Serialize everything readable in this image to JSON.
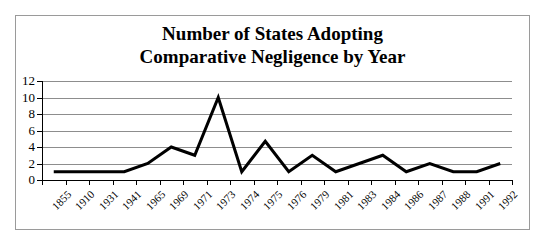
{
  "figure": {
    "border_color": "#9a9a9a",
    "background": "#ffffff"
  },
  "chart_data": {
    "type": "line",
    "title": "Number of States Adopting Comparative Negligence by Year",
    "title_line1": "Number of States Adopting",
    "title_line2": "Comparative Negligence by Year",
    "xlabel": "",
    "ylabel": "",
    "categories": [
      "1855",
      "1910",
      "1931",
      "1941",
      "1965",
      "1969",
      "1971",
      "1973",
      "1974",
      "1975",
      "1976",
      "1979",
      "1981",
      "1983",
      "1984",
      "1986",
      "1987",
      "1988",
      "1991",
      "1992"
    ],
    "values": [
      1,
      1,
      1,
      1,
      2,
      4,
      3,
      10,
      1,
      4.7,
      1,
      3,
      1,
      2,
      3,
      1,
      2,
      1,
      1,
      2
    ],
    "ylim": [
      0,
      12
    ],
    "ytick_labels": [
      "12",
      "10",
      "8",
      "6",
      "4",
      "2",
      "0"
    ],
    "ytick_values": [
      12,
      10,
      8,
      6,
      4,
      2,
      0
    ],
    "grid": true,
    "grid_color": "#8d8d8d",
    "line_color": "#000000",
    "line_width": 3,
    "legend": false,
    "legend_position": "none",
    "xlabel_rotation": -45
  }
}
